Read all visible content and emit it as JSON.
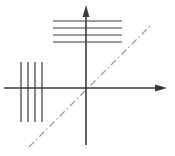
{
  "figure": {
    "background_color": "#ffffff",
    "ink_color": "#3a3a3a",
    "bold_ink_color": "#1c1c1c",
    "dash_dot_color": "#8c8c8c",
    "width": 175,
    "height": 156
  },
  "axes": {
    "origin": {
      "x": 86,
      "y": 88
    },
    "vertical": {
      "name": "z-axis",
      "label": "z",
      "label_x": 92,
      "label_y": 12,
      "x": 86,
      "y_top": 14,
      "y_bottom": 145,
      "arrow": "up",
      "stroke_width": 1.6
    },
    "horizontal": {
      "name": "x-axis",
      "label": "x",
      "label_x": 163,
      "label_y": 92,
      "y": 88,
      "x_left": 4,
      "x_right": 158,
      "arrow": "right",
      "stroke_width": 1.3
    }
  },
  "diagonal": {
    "name": "dash-dot 45 degree line",
    "x1": 29,
    "y1": 147,
    "x2": 150,
    "y2": 26,
    "style": "dash-dot",
    "stroke_width": 1.2,
    "color": "#9a9a9a"
  },
  "wavefronts": [
    {
      "id": "horizontal-wavefront",
      "name": "horizontal-line-group",
      "orientation": "horizontal",
      "count": 4,
      "x_start": 53,
      "x_end": 122,
      "y_values": [
        21,
        28,
        35,
        42
      ],
      "stroke_width": 1.2
    },
    {
      "id": "vertical-wavefront",
      "name": "vertical-line-group",
      "orientation": "vertical",
      "count": 4,
      "y_start": 62,
      "y_end": 122,
      "x_values": [
        21,
        28,
        35,
        42
      ],
      "stroke_width": 1.2
    }
  ],
  "arrows": [
    {
      "id": "down-arrow",
      "name": "downward-propagation-arrow",
      "direction": "down",
      "x1": 81,
      "y1": 45,
      "x2": 81,
      "y2": 79,
      "stroke_width": 2.6,
      "head_width": 8,
      "head_length": 11
    },
    {
      "id": "right-arrow",
      "name": "rightward-propagation-arrow",
      "direction": "right",
      "x1": 44,
      "y1": 84,
      "x2": 79,
      "y2": 84,
      "stroke_width": 2.6,
      "head_width": 8,
      "head_length": 11
    }
  ]
}
